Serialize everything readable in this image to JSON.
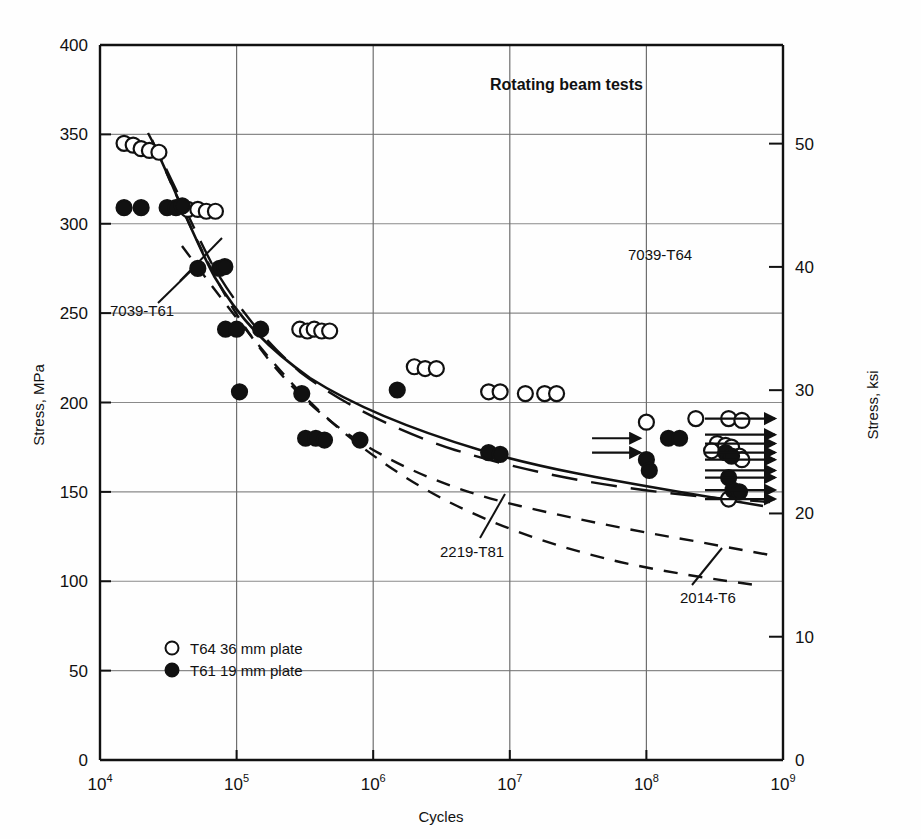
{
  "chart_data": {
    "type": "scatter",
    "title": "Rotating beam tests",
    "xlabel": "Cycles",
    "ylabel": "Stress, MPa",
    "ylabel_right": "Stress, ksi",
    "xscale": "log",
    "xlim": [
      10000,
      1000000000
    ],
    "ylim": [
      0,
      400
    ],
    "ylim_right": [
      0,
      58
    ],
    "grid": true,
    "xticklabels": [
      "10",
      "10",
      "10",
      "10",
      "10",
      "10"
    ],
    "xtick_exponents": [
      "4",
      "5",
      "6",
      "7",
      "8",
      "9"
    ],
    "xticks": [
      10000,
      100000,
      1000000,
      10000000,
      100000000,
      1000000000
    ],
    "yticks": [
      0,
      50,
      100,
      150,
      200,
      250,
      300,
      350,
      400
    ],
    "yticklabels": [
      "0",
      "50",
      "100",
      "150",
      "200",
      "250",
      "300",
      "350",
      "400"
    ],
    "yticks_right": [
      0,
      10,
      20,
      30,
      40,
      50
    ],
    "yticklabels_right": [
      "0",
      "10",
      "20",
      "30",
      "40",
      "50"
    ],
    "legend": [
      {
        "marker": "open-circle",
        "label": "T64 36 mm plate"
      },
      {
        "marker": "filled-circle",
        "label": "T61 19 mm plate"
      }
    ],
    "annotations": [
      {
        "text": "7039-T61",
        "x": 110,
        "y": 310
      },
      {
        "text": "2219-T81",
        "x": 440,
        "y": 551
      },
      {
        "text": "7039-T64",
        "x": 628,
        "y": 254
      },
      {
        "text": "2014-T6",
        "x": 680,
        "y": 597
      }
    ],
    "series": [
      {
        "name": "T64 36 mm plate",
        "marker": "open-circle",
        "points": [
          [
            15000,
            345
          ],
          [
            17500,
            344
          ],
          [
            20000,
            342
          ],
          [
            23000,
            341
          ],
          [
            27000,
            340
          ],
          [
            44000,
            308
          ],
          [
            52000,
            308
          ],
          [
            60000,
            307
          ],
          [
            70000,
            307
          ],
          [
            290000,
            241
          ],
          [
            330000,
            240
          ],
          [
            370000,
            241
          ],
          [
            420000,
            240
          ],
          [
            480000,
            240
          ],
          [
            2000000,
            220
          ],
          [
            2400000,
            219
          ],
          [
            2900000,
            219
          ],
          [
            7000000,
            206
          ],
          [
            8500000,
            206
          ],
          [
            13000000,
            205
          ],
          [
            18000000,
            205
          ],
          [
            22000000,
            205
          ],
          [
            100000000,
            189
          ],
          [
            230000000,
            191
          ],
          [
            400000000,
            191
          ],
          [
            500000000,
            190
          ],
          [
            330000000,
            177
          ],
          [
            380000000,
            176
          ],
          [
            420000000,
            175
          ],
          [
            300000000,
            173
          ],
          [
            480000000,
            170
          ],
          [
            500000000,
            168
          ],
          [
            400000000,
            146
          ]
        ]
      },
      {
        "name": "T61 19 mm plate",
        "marker": "filled-circle",
        "points": [
          [
            15000,
            309
          ],
          [
            20000,
            309
          ],
          [
            31000,
            309
          ],
          [
            36000,
            309
          ],
          [
            40000,
            310
          ],
          [
            52000,
            275
          ],
          [
            75000,
            275
          ],
          [
            82000,
            276
          ],
          [
            83000,
            241
          ],
          [
            100000,
            241
          ],
          [
            150000,
            241
          ],
          [
            105000,
            206
          ],
          [
            300000,
            205
          ],
          [
            320000,
            180
          ],
          [
            380000,
            180
          ],
          [
            440000,
            179
          ],
          [
            800000,
            179
          ],
          [
            1500000,
            207
          ],
          [
            7000000,
            172
          ],
          [
            8500000,
            171
          ],
          [
            100000000,
            168
          ],
          [
            105000000,
            162
          ],
          [
            145000000,
            180
          ],
          [
            175000000,
            180
          ],
          [
            380000000,
            172
          ],
          [
            420000000,
            170
          ],
          [
            400000000,
            158
          ],
          [
            430000000,
            151
          ],
          [
            480000000,
            150
          ]
        ]
      }
    ],
    "curves": [
      {
        "name": "7039-T64",
        "style": "solid"
      },
      {
        "name": "7039-T61",
        "style": "long-dash"
      },
      {
        "name": "2219-T81",
        "style": "dashed"
      },
      {
        "name": "2014-T6",
        "style": "dashed"
      }
    ]
  }
}
